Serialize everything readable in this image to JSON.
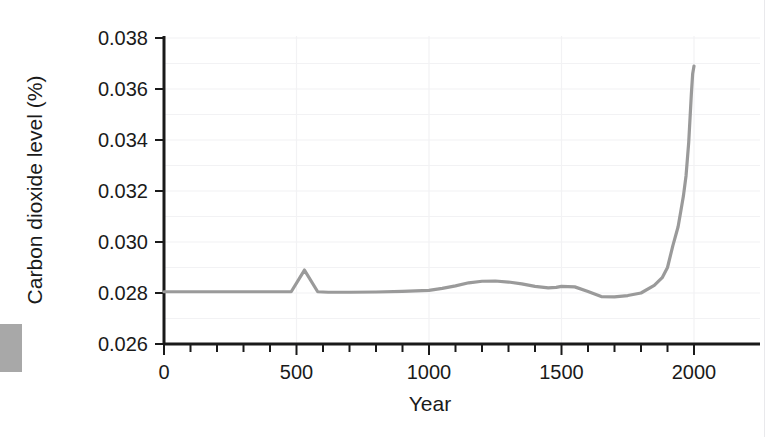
{
  "chart_data": {
    "type": "line",
    "title": "",
    "xlabel": "Year",
    "ylabel": "Carbon dioxide level (%)",
    "xlim": [
      0,
      2000
    ],
    "ylim": [
      0.026,
      0.038
    ],
    "xticks": [
      0,
      500,
      1000,
      1500,
      2000
    ],
    "xtick_labels": [
      "0",
      "500",
      "1000",
      "1500",
      "2000"
    ],
    "yticks": [
      0.026,
      0.028,
      0.03,
      0.032,
      0.034,
      0.036,
      0.038
    ],
    "ytick_labels": [
      "0.026",
      "0.028",
      "0.030",
      "0.032",
      "0.034",
      "0.036",
      "0.038"
    ],
    "x_minor_tick_step": 100,
    "grid": true,
    "grid_color": "#f2f2f4",
    "legend": null,
    "series": [
      {
        "name": "Carbon dioxide level",
        "color": "#9a9a9a",
        "line_width": 3.2,
        "x": [
          0,
          100,
          200,
          300,
          400,
          480,
          530,
          580,
          620,
          700,
          800,
          900,
          1000,
          1050,
          1100,
          1150,
          1200,
          1250,
          1300,
          1350,
          1400,
          1450,
          1480,
          1500,
          1550,
          1600,
          1650,
          1700,
          1750,
          1800,
          1850,
          1880,
          1900,
          1920,
          1940,
          1950,
          1960,
          1970,
          1980,
          1990,
          1995,
          2000
        ],
        "y": [
          0.02805,
          0.02805,
          0.02805,
          0.02805,
          0.02805,
          0.02805,
          0.0289,
          0.02805,
          0.02803,
          0.02803,
          0.02804,
          0.02806,
          0.0281,
          0.02818,
          0.02828,
          0.0284,
          0.02846,
          0.02847,
          0.02843,
          0.02836,
          0.02826,
          0.0282,
          0.02822,
          0.02826,
          0.02824,
          0.02806,
          0.02786,
          0.02785,
          0.0279,
          0.028,
          0.0283,
          0.0286,
          0.029,
          0.02985,
          0.0306,
          0.0312,
          0.0318,
          0.0326,
          0.0339,
          0.0358,
          0.0366,
          0.0369
        ]
      }
    ]
  },
  "axes": {
    "y_axis_title": "Carbon dioxide level (%)",
    "x_axis_title": "Year"
  }
}
